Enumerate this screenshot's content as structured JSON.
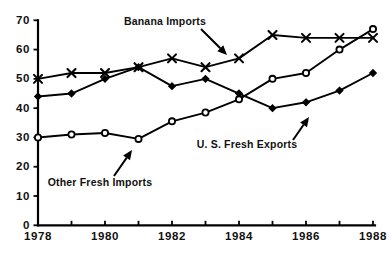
{
  "chart_data": {
    "type": "line",
    "title": "",
    "subtitle": "",
    "xlabel": "",
    "ylabel": "",
    "xlim": [
      1978,
      1988
    ],
    "ylim": [
      0,
      70
    ],
    "grid": false,
    "legend_position": "inline-annotations",
    "x": [
      1978,
      1979,
      1980,
      1981,
      1982,
      1983,
      1984,
      1985,
      1986,
      1987,
      1988
    ],
    "x_tick_labels": [
      "1978",
      "",
      "1980",
      "",
      "1982",
      "",
      "1984",
      "",
      "1986",
      "",
      "1988"
    ],
    "y_ticks": [
      0,
      10,
      20,
      30,
      40,
      50,
      60,
      70
    ],
    "y_tick_labels": [
      "0",
      "10",
      "20",
      "30",
      "40",
      "50",
      "60",
      "70"
    ],
    "series": [
      {
        "name": "Banana Imports",
        "marker": "x-cross",
        "values": [
          50,
          52,
          52,
          54,
          57,
          54,
          57,
          65,
          64,
          64,
          64
        ]
      },
      {
        "name": "U. S. Fresh Exports",
        "marker": "filled-diamond",
        "values": [
          44,
          45,
          50,
          54,
          47.5,
          50,
          45,
          40,
          42,
          46,
          52
        ]
      },
      {
        "name": "Other Fresh Imports",
        "marker": "open-circle",
        "values": [
          30,
          31,
          31.5,
          29.5,
          35.5,
          38.5,
          43,
          50,
          52,
          60,
          67
        ]
      }
    ],
    "annotations": [
      {
        "text": "Banana Imports",
        "text_x": 165,
        "text_y": 22,
        "anchor": "middle",
        "arrow_from_x": 201,
        "arrow_from_y": 29,
        "arrow_to_x": 227,
        "arrow_to_y": 55
      },
      {
        "text": "Other Fresh Imports",
        "text_x": 100,
        "text_y": 183,
        "anchor": "middle",
        "arrow_from_x": 114,
        "arrow_from_y": 176,
        "arrow_to_x": 132,
        "arrow_to_y": 150
      },
      {
        "text": "U. S. Fresh Exports",
        "text_x": 247,
        "text_y": 145,
        "anchor": "middle",
        "arrow_from_x": 293,
        "arrow_from_y": 140,
        "arrow_to_x": 309,
        "arrow_to_y": 117
      }
    ]
  }
}
